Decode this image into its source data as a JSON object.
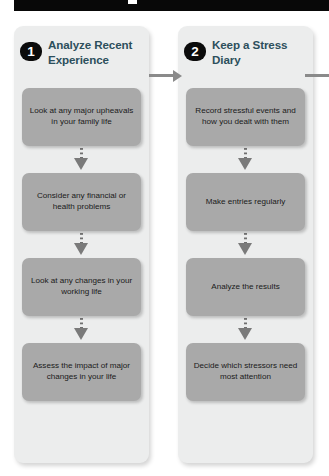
{
  "document": {
    "top_bar": {
      "present": true,
      "color": "#080808"
    }
  },
  "diagram": {
    "type": "flowchart",
    "orientation": "horizontal-steps-with-vertical-substeps",
    "colors": {
      "panel_background": "#eceded",
      "step_background": "#a9a9a9",
      "badge_background": "#0b0b0b",
      "badge_text": "#ffffff",
      "title_text": "#2c4f5c",
      "step_text": "#1a1a1a",
      "connector": "#7a7a7a",
      "arrow": "#8a8a8a"
    },
    "columns": [
      {
        "number": "1",
        "title": "Analyze Recent Experience",
        "steps": [
          "Look at any major upheavals in your family life",
          "Consider any financial or health problems",
          "Look at any changes in your working life",
          "Assess the impact of major changes in your life"
        ]
      },
      {
        "number": "2",
        "title": "Keep a Stress Diary",
        "steps": [
          "Record stressful events and how you dealt with them",
          "Make entries regularly",
          "Analyze the results",
          "Decide which stressors need most attention"
        ]
      }
    ],
    "arrows": [
      {
        "name": "arrow-step1-to-step2",
        "from": "1",
        "to": "2"
      },
      {
        "name": "arrow-step2-to-next",
        "from": "2",
        "to": "offscreen"
      }
    ]
  }
}
